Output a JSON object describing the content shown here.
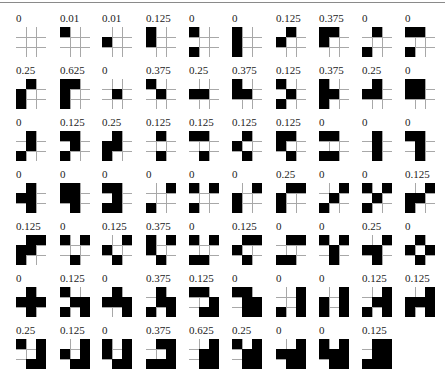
{
  "figure": {
    "grid_size": 3,
    "columns": 10,
    "rows": 7,
    "colors": {
      "filled": "#000000",
      "gridline": "#a8a8a8",
      "background": "#ffffff",
      "topline": "#8a8a8a"
    },
    "items": [
      {
        "label": "0",
        "cells": []
      },
      {
        "label": "0.01",
        "cells": [
          [
            0,
            0
          ]
        ]
      },
      {
        "label": "0.01",
        "cells": [
          [
            1,
            0
          ]
        ]
      },
      {
        "label": "0.125",
        "cells": [
          [
            0,
            0
          ],
          [
            1,
            0
          ]
        ]
      },
      {
        "label": "0",
        "cells": [
          [
            0,
            0
          ],
          [
            2,
            0
          ]
        ]
      },
      {
        "label": "0",
        "cells": [
          [
            0,
            0
          ],
          [
            1,
            0
          ],
          [
            2,
            0
          ]
        ]
      },
      {
        "label": "0.125",
        "cells": [
          [
            0,
            1
          ],
          [
            1,
            0
          ]
        ]
      },
      {
        "label": "0.375",
        "cells": [
          [
            0,
            0
          ],
          [
            0,
            1
          ],
          [
            1,
            0
          ]
        ]
      },
      {
        "label": "0",
        "cells": [
          [
            0,
            1
          ],
          [
            2,
            0
          ]
        ]
      },
      {
        "label": "0",
        "cells": [
          [
            0,
            0
          ],
          [
            0,
            1
          ],
          [
            2,
            0
          ]
        ]
      },
      {
        "label": "0.25",
        "cells": [
          [
            0,
            1
          ],
          [
            1,
            0
          ],
          [
            2,
            0
          ]
        ]
      },
      {
        "label": "0.625",
        "cells": [
          [
            0,
            0
          ],
          [
            0,
            1
          ],
          [
            1,
            0
          ],
          [
            2,
            0
          ]
        ]
      },
      {
        "label": "0",
        "cells": [
          [
            1,
            1
          ]
        ]
      },
      {
        "label": "0.375",
        "cells": [
          [
            0,
            0
          ],
          [
            1,
            1
          ]
        ]
      },
      {
        "label": "0.25",
        "cells": [
          [
            1,
            0
          ],
          [
            1,
            1
          ]
        ]
      },
      {
        "label": "0.375",
        "cells": [
          [
            0,
            0
          ],
          [
            1,
            0
          ],
          [
            1,
            1
          ]
        ]
      },
      {
        "label": "0.125",
        "cells": [
          [
            0,
            0
          ],
          [
            1,
            1
          ],
          [
            2,
            0
          ]
        ]
      },
      {
        "label": "0.375",
        "cells": [
          [
            0,
            0
          ],
          [
            1,
            0
          ],
          [
            1,
            1
          ],
          [
            2,
            0
          ]
        ]
      },
      {
        "label": "0.25",
        "cells": [
          [
            0,
            1
          ],
          [
            1,
            0
          ],
          [
            1,
            1
          ]
        ]
      },
      {
        "label": "0",
        "cells": [
          [
            0,
            0
          ],
          [
            0,
            1
          ],
          [
            1,
            0
          ],
          [
            1,
            1
          ]
        ]
      },
      {
        "label": "0",
        "cells": [
          [
            0,
            1
          ],
          [
            1,
            1
          ],
          [
            2,
            0
          ]
        ]
      },
      {
        "label": "0.125",
        "cells": [
          [
            0,
            0
          ],
          [
            0,
            1
          ],
          [
            1,
            1
          ],
          [
            2,
            0
          ]
        ]
      },
      {
        "label": "0.25",
        "cells": [
          [
            0,
            1
          ],
          [
            1,
            0
          ],
          [
            1,
            1
          ],
          [
            2,
            0
          ]
        ]
      },
      {
        "label": "0.125",
        "cells": [
          [
            0,
            1
          ],
          [
            2,
            1
          ]
        ]
      },
      {
        "label": "0.125",
        "cells": [
          [
            0,
            0
          ],
          [
            0,
            1
          ],
          [
            2,
            1
          ]
        ]
      },
      {
        "label": "0.125",
        "cells": [
          [
            0,
            1
          ],
          [
            1,
            0
          ],
          [
            2,
            1
          ]
        ]
      },
      {
        "label": "0.125",
        "cells": [
          [
            0,
            0
          ],
          [
            0,
            1
          ],
          [
            1,
            0
          ],
          [
            2,
            1
          ]
        ]
      },
      {
        "label": "0",
        "cells": [
          [
            0,
            0
          ],
          [
            0,
            1
          ],
          [
            2,
            0
          ],
          [
            2,
            1
          ]
        ]
      },
      {
        "label": "0",
        "cells": [
          [
            0,
            1
          ],
          [
            1,
            1
          ],
          [
            2,
            1
          ]
        ]
      },
      {
        "label": "0",
        "cells": [
          [
            0,
            0
          ],
          [
            0,
            1
          ],
          [
            1,
            1
          ],
          [
            2,
            1
          ]
        ]
      },
      {
        "label": "0",
        "cells": [
          [
            0,
            1
          ],
          [
            1,
            0
          ],
          [
            1,
            1
          ],
          [
            2,
            1
          ]
        ]
      },
      {
        "label": "0",
        "cells": [
          [
            0,
            0
          ],
          [
            0,
            1
          ],
          [
            1,
            0
          ],
          [
            1,
            1
          ],
          [
            2,
            1
          ]
        ]
      },
      {
        "label": "0",
        "cells": [
          [
            0,
            0
          ],
          [
            0,
            1
          ],
          [
            1,
            1
          ],
          [
            2,
            0
          ],
          [
            2,
            1
          ]
        ]
      },
      {
        "label": "0",
        "cells": [
          [
            0,
            2
          ],
          [
            2,
            0
          ]
        ]
      },
      {
        "label": "0",
        "cells": [
          [
            0,
            0
          ],
          [
            0,
            2
          ],
          [
            2,
            0
          ]
        ]
      },
      {
        "label": "0",
        "cells": [
          [
            0,
            2
          ],
          [
            1,
            0
          ],
          [
            2,
            0
          ]
        ]
      },
      {
        "label": "0.25",
        "cells": [
          [
            0,
            1
          ],
          [
            0,
            2
          ],
          [
            1,
            0
          ],
          [
            2,
            0
          ]
        ]
      },
      {
        "label": "0",
        "cells": [
          [
            0,
            2
          ],
          [
            1,
            1
          ],
          [
            2,
            0
          ]
        ]
      },
      {
        "label": "0",
        "cells": [
          [
            0,
            0
          ],
          [
            0,
            2
          ],
          [
            1,
            1
          ],
          [
            2,
            0
          ]
        ]
      },
      {
        "label": "0.125",
        "cells": [
          [
            0,
            2
          ],
          [
            1,
            0
          ],
          [
            1,
            1
          ],
          [
            2,
            0
          ]
        ]
      },
      {
        "label": "0.125",
        "cells": [
          [
            0,
            1
          ],
          [
            0,
            2
          ],
          [
            1,
            0
          ],
          [
            1,
            1
          ],
          [
            2,
            0
          ]
        ]
      },
      {
        "label": "0",
        "cells": [
          [
            0,
            0
          ],
          [
            0,
            2
          ],
          [
            2,
            1
          ]
        ]
      },
      {
        "label": "0.125",
        "cells": [
          [
            0,
            2
          ],
          [
            1,
            0
          ],
          [
            2,
            1
          ]
        ]
      },
      {
        "label": "0.375",
        "cells": [
          [
            0,
            0
          ],
          [
            0,
            2
          ],
          [
            1,
            0
          ],
          [
            2,
            1
          ]
        ]
      },
      {
        "label": "0",
        "cells": [
          [
            0,
            0
          ],
          [
            0,
            2
          ],
          [
            2,
            0
          ],
          [
            2,
            1
          ]
        ]
      },
      {
        "label": "0.125",
        "cells": [
          [
            0,
            1
          ],
          [
            0,
            2
          ],
          [
            1,
            0
          ],
          [
            2,
            1
          ]
        ]
      },
      {
        "label": "0",
        "cells": [
          [
            0,
            1
          ],
          [
            0,
            2
          ],
          [
            2,
            0
          ],
          [
            2,
            1
          ]
        ]
      },
      {
        "label": "0",
        "cells": [
          [
            0,
            0
          ],
          [
            0,
            2
          ],
          [
            1,
            1
          ],
          [
            2,
            1
          ]
        ]
      },
      {
        "label": "0.25",
        "cells": [
          [
            0,
            2
          ],
          [
            1,
            0
          ],
          [
            1,
            1
          ],
          [
            2,
            1
          ]
        ]
      },
      {
        "label": "0",
        "cells": [
          [
            0,
            1
          ],
          [
            1,
            0
          ],
          [
            1,
            2
          ],
          [
            2,
            1
          ]
        ]
      },
      {
        "label": "0",
        "cells": [
          [
            0,
            1
          ],
          [
            1,
            0
          ],
          [
            1,
            1
          ],
          [
            1,
            2
          ],
          [
            2,
            1
          ]
        ]
      },
      {
        "label": "0.125",
        "cells": [
          [
            0,
            0
          ],
          [
            1,
            1
          ],
          [
            1,
            2
          ],
          [
            2,
            0
          ],
          [
            2,
            2
          ]
        ]
      },
      {
        "label": "0",
        "cells": [
          [
            0,
            1
          ],
          [
            1,
            0
          ],
          [
            1,
            1
          ],
          [
            1,
            2
          ],
          [
            2,
            2
          ]
        ]
      },
      {
        "label": "0.375",
        "cells": [
          [
            0,
            1
          ],
          [
            1,
            1
          ],
          [
            1,
            2
          ],
          [
            2,
            0
          ],
          [
            2,
            2
          ]
        ]
      },
      {
        "label": "0.125",
        "cells": [
          [
            0,
            0
          ],
          [
            0,
            1
          ],
          [
            1,
            2
          ],
          [
            2,
            1
          ],
          [
            2,
            2
          ]
        ]
      },
      {
        "label": "0",
        "cells": [
          [
            0,
            0
          ],
          [
            0,
            1
          ],
          [
            1,
            1
          ],
          [
            1,
            2
          ],
          [
            2,
            1
          ],
          [
            2,
            2
          ]
        ]
      },
      {
        "label": "0",
        "cells": [
          [
            0,
            2
          ],
          [
            1,
            2
          ],
          [
            2,
            0
          ],
          [
            2,
            2
          ]
        ]
      },
      {
        "label": "0",
        "cells": [
          [
            0,
            2
          ],
          [
            1,
            0
          ],
          [
            1,
            2
          ],
          [
            2,
            0
          ],
          [
            2,
            2
          ]
        ]
      },
      {
        "label": "0.125",
        "cells": [
          [
            0,
            2
          ],
          [
            1,
            1
          ],
          [
            1,
            2
          ],
          [
            2,
            0
          ],
          [
            2,
            2
          ]
        ]
      },
      {
        "label": "0.125",
        "cells": [
          [
            0,
            2
          ],
          [
            1,
            0
          ],
          [
            1,
            1
          ],
          [
            1,
            2
          ],
          [
            2,
            0
          ],
          [
            2,
            2
          ]
        ]
      },
      {
        "label": "0.25",
        "cells": [
          [
            0,
            0
          ],
          [
            0,
            2
          ],
          [
            1,
            2
          ],
          [
            2,
            1
          ],
          [
            2,
            2
          ]
        ]
      },
      {
        "label": "0.125",
        "cells": [
          [
            0,
            2
          ],
          [
            1,
            0
          ],
          [
            1,
            2
          ],
          [
            2,
            1
          ],
          [
            2,
            2
          ]
        ]
      },
      {
        "label": "0",
        "cells": [
          [
            0,
            0
          ],
          [
            0,
            2
          ],
          [
            1,
            0
          ],
          [
            1,
            2
          ],
          [
            2,
            1
          ],
          [
            2,
            2
          ]
        ]
      },
      {
        "label": "0.375",
        "cells": [
          [
            0,
            1
          ],
          [
            0,
            2
          ],
          [
            1,
            2
          ],
          [
            2,
            0
          ],
          [
            2,
            1
          ],
          [
            2,
            2
          ]
        ]
      },
      {
        "label": "0.625",
        "cells": [
          [
            0,
            2
          ],
          [
            1,
            1
          ],
          [
            1,
            2
          ],
          [
            2,
            1
          ],
          [
            2,
            2
          ]
        ]
      },
      {
        "label": "0.25",
        "cells": [
          [
            0,
            0
          ],
          [
            0,
            2
          ],
          [
            1,
            1
          ],
          [
            1,
            2
          ],
          [
            2,
            1
          ],
          [
            2,
            2
          ]
        ]
      },
      {
        "label": "0",
        "cells": [
          [
            0,
            2
          ],
          [
            1,
            0
          ],
          [
            1,
            1
          ],
          [
            1,
            2
          ],
          [
            2,
            1
          ],
          [
            2,
            2
          ]
        ]
      },
      {
        "label": "0",
        "cells": [
          [
            0,
            0
          ],
          [
            0,
            2
          ],
          [
            1,
            0
          ],
          [
            1,
            1
          ],
          [
            1,
            2
          ],
          [
            2,
            1
          ],
          [
            2,
            2
          ]
        ]
      },
      {
        "label": "0.125",
        "cells": [
          [
            0,
            1
          ],
          [
            0,
            2
          ],
          [
            1,
            1
          ],
          [
            1,
            2
          ],
          [
            2,
            0
          ],
          [
            2,
            1
          ],
          [
            2,
            2
          ]
        ]
      }
    ]
  }
}
